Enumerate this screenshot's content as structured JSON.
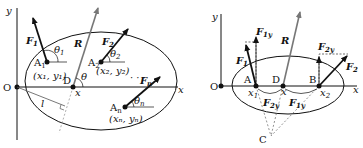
{
  "left_diagram": {
    "axes": {
      "x_label": "x",
      "y_label": "y",
      "origin_label": "O"
    },
    "resultant": {
      "label": "R",
      "angle_label": "θ",
      "point_label": "D",
      "point_coord": "x"
    },
    "forces": [
      {
        "label": "F",
        "sub": "1",
        "point": "A",
        "point_sub": "1",
        "coord": "(x₁, y₁)",
        "angle_label": "θ",
        "angle_sub": "1"
      },
      {
        "label": "F",
        "sub": "2",
        "point": "A",
        "point_sub": "2",
        "coord": "(x₂, y₂)",
        "angle_label": "θ",
        "angle_sub": "2"
      },
      {
        "label": "F",
        "sub": "n",
        "point": "A",
        "point_sub": "n",
        "coord": "(xₙ, yₙ)",
        "angle_label": "θ",
        "angle_sub": "n"
      }
    ],
    "moment_arm_label": "l",
    "ellipsis": "· · ·"
  },
  "right_diagram": {
    "axes": {
      "x_label": "x",
      "y_label": "y",
      "origin_label": "O"
    },
    "resultant": {
      "label": "R",
      "point_label": "D",
      "point_coord": "x"
    },
    "point_a": {
      "label": "A",
      "coord": "x",
      "coord_sub": "1"
    },
    "point_b": {
      "label": "B",
      "coord": "x",
      "coord_sub": "2"
    },
    "point_c": {
      "label": "C"
    },
    "forces": [
      {
        "label": "F",
        "sub": "1"
      },
      {
        "label": "F",
        "sub": "2"
      }
    ],
    "components": [
      {
        "label": "F",
        "sub": "1y"
      },
      {
        "label": "F",
        "sub": "2y"
      }
    ]
  }
}
